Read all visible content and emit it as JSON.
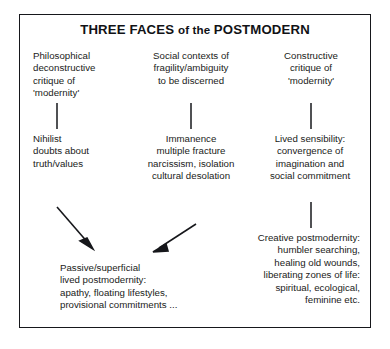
{
  "diagram": {
    "title_main_1": "THREE FACES ",
    "title_small": "of the ",
    "title_main_2": "POSTMODERN",
    "title_full": "THREE FACES of the POSTMODERN",
    "border_color": "#16171b",
    "text_color": "#1a1b20",
    "background": "#ffffff",
    "columns": [
      {
        "id": "philosophical",
        "align": "left",
        "top": "Philosophical\ndeconstructive\ncritique of\n'modernity'",
        "middle": "Nihilist\ndoubts about\ntruth/values"
      },
      {
        "id": "social-contexts",
        "align": "center",
        "top": "Social contexts of\nfragility/ambiguity\nto be discerned",
        "middle": "Immanence\nmultiple fracture\nnarcissism, isolation\ncultural desolation"
      },
      {
        "id": "constructive",
        "align": "center",
        "top": "Constructive\ncritique of\n'modernity'",
        "middle": "Lived sensibility:\nconvergence of\nimagination and\nsocial commitment",
        "bottom": "Creative postmodernity:\nhumbler searching,\nhealing old wounds,\nliberating zones of life:\nspiritual, ecological,\nfeminine etc."
      }
    ],
    "outcome_left": "Passive/superficial\nlived postmodernity:\napathy, floating lifestyles,\nprovisional commitments ...",
    "connectors": [
      {
        "id": "philosophical-connector",
        "x": 57,
        "y1": 103,
        "y2": 129
      },
      {
        "id": "social-contexts-connector",
        "x": 191,
        "y1": 103,
        "y2": 129
      },
      {
        "id": "constructive-connector-top",
        "x": 311,
        "y1": 103,
        "y2": 129
      },
      {
        "id": "constructive-connector-bottom",
        "x": 311,
        "y1": 202,
        "y2": 228
      }
    ],
    "arrows": [
      {
        "id": "philosophical-to-passive",
        "x1": 57,
        "y1": 207,
        "x2": 92,
        "y2": 247
      },
      {
        "id": "social-to-passive",
        "x1": 196,
        "y1": 224,
        "x2": 154,
        "y2": 251
      }
    ]
  }
}
